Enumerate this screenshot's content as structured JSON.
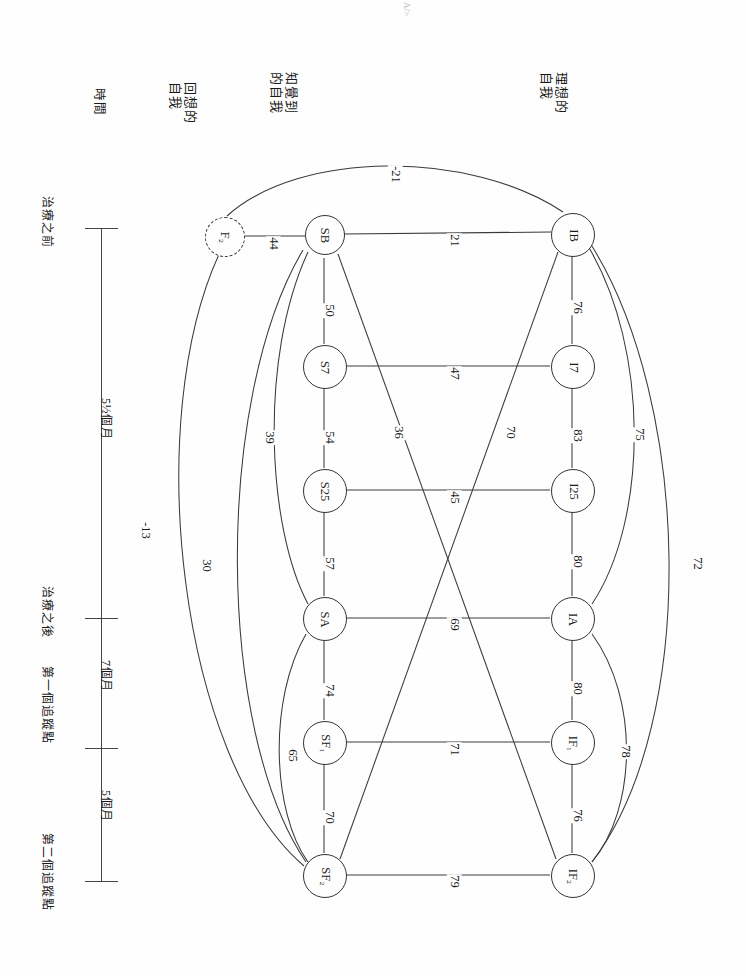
{
  "figure": {
    "orientation": "rotated-90",
    "corner_mark": "A/>",
    "column_headers": [
      {
        "id": "ideal-self",
        "label": "理想的\n自我"
      },
      {
        "id": "perceived-self",
        "label": "知覺到\n的自我"
      },
      {
        "id": "recalled-self",
        "label": "回想的\n自我"
      },
      {
        "id": "time",
        "label": "時間"
      }
    ],
    "timeline": {
      "axis_label": "時間",
      "points": [
        {
          "id": "pre-treatment",
          "label": "治療之前"
        },
        {
          "id": "post-treatment",
          "label": "治療之後"
        },
        {
          "id": "followup-1",
          "label": "第一個追蹤點"
        },
        {
          "id": "followup-2",
          "label": "第二個追蹤點"
        }
      ],
      "intervals": [
        {
          "id": "interval-1",
          "label": "5½個月"
        },
        {
          "id": "interval-2",
          "label": "7個月"
        },
        {
          "id": "interval-3",
          "label": "5個月"
        }
      ]
    },
    "nodes": [
      {
        "id": "F2",
        "label": "F₂",
        "style": "dashed",
        "col": "recalled-self"
      },
      {
        "id": "SB",
        "label": "SB",
        "style": "solid",
        "col": "perceived-self"
      },
      {
        "id": "S7",
        "label": "S7",
        "style": "solid",
        "col": "perceived-self"
      },
      {
        "id": "S25",
        "label": "S25",
        "style": "solid",
        "col": "perceived-self"
      },
      {
        "id": "SA",
        "label": "SA",
        "style": "solid",
        "col": "perceived-self"
      },
      {
        "id": "SF1",
        "label": "SF₁",
        "style": "solid",
        "col": "perceived-self"
      },
      {
        "id": "SF2",
        "label": "SF₂",
        "style": "solid",
        "col": "perceived-self"
      },
      {
        "id": "IB",
        "label": "IB",
        "style": "solid",
        "col": "ideal-self"
      },
      {
        "id": "I7",
        "label": "I7",
        "style": "solid",
        "col": "ideal-self"
      },
      {
        "id": "I25",
        "label": "I25",
        "style": "solid",
        "col": "ideal-self"
      },
      {
        "id": "IA",
        "label": "IA",
        "style": "solid",
        "col": "ideal-self"
      },
      {
        "id": "IF1",
        "label": "IF₁",
        "style": "solid",
        "col": "ideal-self"
      },
      {
        "id": "IF2",
        "label": "IF₂",
        "style": "solid",
        "col": "ideal-self"
      }
    ],
    "edges": [
      {
        "from": "F2",
        "to": "IB",
        "value": "-21",
        "shape": "arc"
      },
      {
        "from": "F2",
        "to": "SB",
        "value": "44",
        "shape": "straight"
      },
      {
        "from": "SB",
        "to": "IB",
        "value": "21",
        "shape": "straight"
      },
      {
        "from": "SB",
        "to": "S7",
        "value": "50",
        "shape": "straight"
      },
      {
        "from": "S7",
        "to": "I7",
        "value": "47",
        "shape": "straight"
      },
      {
        "from": "IB",
        "to": "I7",
        "value": "76",
        "shape": "straight"
      },
      {
        "from": "S7",
        "to": "S25",
        "value": "54",
        "shape": "straight"
      },
      {
        "from": "I7",
        "to": "I25",
        "value": "83",
        "shape": "straight"
      },
      {
        "from": "SB",
        "to": "IF2",
        "value": "36",
        "shape": "diagonal"
      },
      {
        "from": "IB",
        "to": "SF2",
        "value": "70",
        "shape": "diagonal"
      },
      {
        "from": "S25",
        "to": "I25",
        "value": "45",
        "shape": "straight"
      },
      {
        "from": "IB",
        "to": "IA",
        "value": "75",
        "shape": "arc"
      },
      {
        "from": "IB",
        "to": "IF2",
        "value": "72",
        "shape": "arc"
      },
      {
        "from": "SB",
        "to": "SA",
        "value": "39",
        "shape": "arc"
      },
      {
        "from": "SB",
        "to": "SF2",
        "value": "30",
        "shape": "arc"
      },
      {
        "from": "F2",
        "to": "SF2",
        "value": "-13",
        "shape": "arc"
      },
      {
        "from": "S25",
        "to": "SA",
        "value": "57",
        "shape": "straight"
      },
      {
        "from": "I25",
        "to": "IA",
        "value": "80",
        "shape": "straight"
      },
      {
        "from": "SA",
        "to": "IA",
        "value": "69",
        "shape": "straight"
      },
      {
        "from": "SA",
        "to": "SF1",
        "value": "74",
        "shape": "straight"
      },
      {
        "from": "IA",
        "to": "IF1",
        "value": "80",
        "shape": "straight"
      },
      {
        "from": "SA",
        "to": "SF2",
        "value": "65",
        "shape": "arc"
      },
      {
        "from": "IA",
        "to": "IF2",
        "value": "78",
        "shape": "arc"
      },
      {
        "from": "SF1",
        "to": "IF1",
        "value": "71",
        "shape": "straight"
      },
      {
        "from": "SF1",
        "to": "SF2",
        "value": "70",
        "shape": "straight"
      },
      {
        "from": "IF1",
        "to": "IF2",
        "value": "76",
        "shape": "straight"
      },
      {
        "from": "SF2",
        "to": "IF2",
        "value": "79",
        "shape": "straight"
      }
    ]
  }
}
